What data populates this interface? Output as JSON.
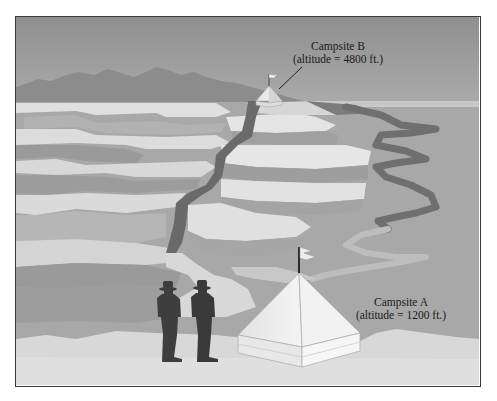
{
  "figure": {
    "type": "illustration",
    "colors": {
      "frame_border": "#3a3a3a",
      "sky_top": "#9a9a9a",
      "sky_bottom": "#e4e4e4",
      "mountains": "#8c8c8c",
      "terrain": "#a8a8a8",
      "terrace_light": "#dedede",
      "terrace_shadow": "#939393",
      "trail_dark": "#6e6e6e",
      "ground": "#d8d8d8",
      "silhouette": "#3d3d3d",
      "tent": "#ececec"
    }
  },
  "campsites": [
    {
      "id": "campsite-b",
      "name": "Campsite B",
      "altitude_text": "(altitude = 4800 ft.)",
      "altitude_ft": 4800
    },
    {
      "id": "campsite-a",
      "name": "Campsite A",
      "altitude_text": "(altitude = 1200 ft.)",
      "altitude_ft": 1200
    }
  ],
  "figures": {
    "hiker_count": 2
  }
}
